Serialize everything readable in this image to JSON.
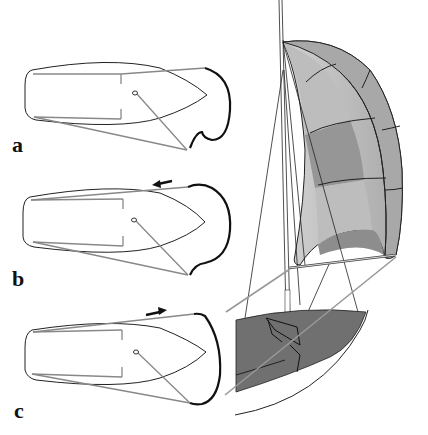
{
  "figure": {
    "panels": [
      {
        "id": "a",
        "label": "a",
        "arrow": "none"
      },
      {
        "id": "b",
        "label": "b",
        "arrow": "left"
      },
      {
        "id": "c",
        "label": "c",
        "arrow": "right"
      }
    ],
    "colors": {
      "hull_outline": "#222222",
      "sheet_line": "#8a8a8a",
      "spinnaker_foot": "#111111",
      "deck": "#707070",
      "sail_light": "#c8c8c8",
      "sail_mid": "#a6a6a6",
      "sail_dark": "#8e8e8e"
    }
  }
}
